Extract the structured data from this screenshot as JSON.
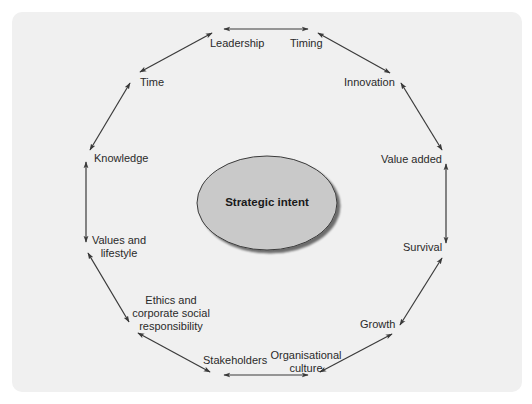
{
  "diagram": {
    "type": "cycle",
    "center": {
      "label": "Strategic intent"
    },
    "nodes": [
      {
        "id": "leadership",
        "label": "Leadership"
      },
      {
        "id": "timing",
        "label": "Timing"
      },
      {
        "id": "innovation",
        "label": "Innovation"
      },
      {
        "id": "value_added",
        "label": "Value added"
      },
      {
        "id": "survival",
        "label": "Survival"
      },
      {
        "id": "growth",
        "label": "Growth"
      },
      {
        "id": "organisational_culture",
        "label_line1": "Organisational",
        "label_line2": "culture"
      },
      {
        "id": "stakeholders",
        "label": "Stakeholders"
      },
      {
        "id": "ethics",
        "label_line1": "Ethics and",
        "label_line2": "corporate social",
        "label_line3": "responsibility"
      },
      {
        "id": "values_lifestyle",
        "label_line1": "Values and",
        "label_line2": "lifestyle"
      },
      {
        "id": "knowledge",
        "label": "Knowledge"
      },
      {
        "id": "time",
        "label": "Time"
      }
    ],
    "edges": [
      [
        "leadership",
        "timing"
      ],
      [
        "timing",
        "innovation"
      ],
      [
        "innovation",
        "value_added"
      ],
      [
        "value_added",
        "survival"
      ],
      [
        "survival",
        "growth"
      ],
      [
        "growth",
        "organisational_culture"
      ],
      [
        "organisational_culture",
        "stakeholders"
      ],
      [
        "stakeholders",
        "ethics"
      ],
      [
        "ethics",
        "values_lifestyle"
      ],
      [
        "values_lifestyle",
        "knowledge"
      ],
      [
        "knowledge",
        "time"
      ],
      [
        "time",
        "leadership"
      ]
    ],
    "edge_style": "double-headed arrow",
    "colors": {
      "panel": "#f0f0f0",
      "ellipse_fill": "#c9c9c9",
      "ellipse_stroke": "#3a3a3a",
      "arrow": "#3a3a3a",
      "text": "#2a2a2a"
    }
  }
}
